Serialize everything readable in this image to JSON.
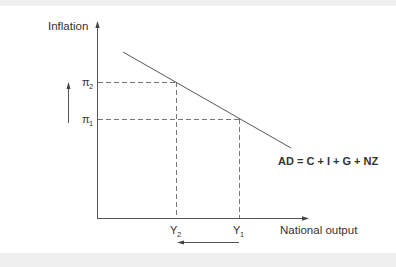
{
  "diagram": {
    "y_axis_label": "Inflation",
    "x_axis_label": "National output",
    "curve_label": "AD = C + I + G + NZ",
    "y_ticks": [
      {
        "symbol": "π",
        "sub": "2",
        "name": "pi-2"
      },
      {
        "symbol": "π",
        "sub": "1",
        "name": "pi-1"
      }
    ],
    "x_ticks": [
      {
        "symbol": "Y",
        "sub": "2",
        "name": "y-2"
      },
      {
        "symbol": "Y",
        "sub": "1",
        "name": "y-1"
      }
    ],
    "annotations": {
      "up_arrow": "inflation rises from π1 to π2",
      "left_arrow": "output falls from Y1 to Y2"
    },
    "colors": {
      "line": "#555555",
      "text": "#333333",
      "band": "#efefef"
    }
  }
}
